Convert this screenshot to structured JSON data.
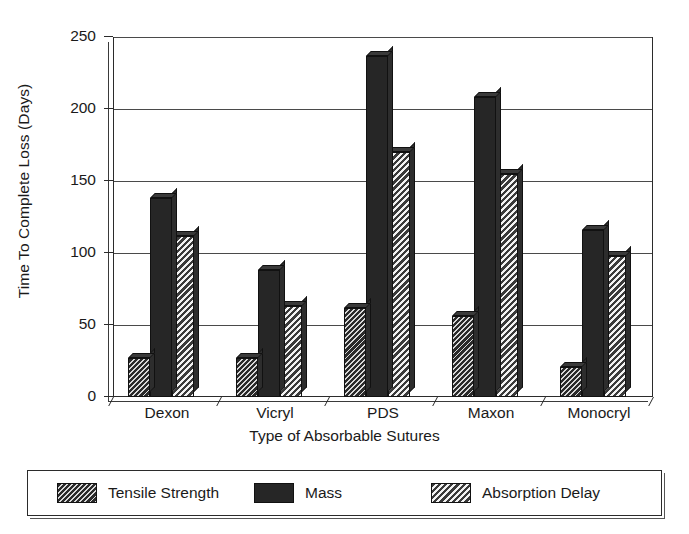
{
  "chart_data": {
    "type": "bar",
    "title": "",
    "xlabel": "Type of Absorbable Sutures",
    "ylabel": "Time To Complete Loss (Days)",
    "categories": [
      "Dexon",
      "Vicryl",
      "PDS",
      "Maxon",
      "Monocryl"
    ],
    "series": [
      {
        "name": "Tensile Strength",
        "values": [
          27,
          27,
          62,
          56,
          21
        ]
      },
      {
        "name": "Mass",
        "values": [
          138,
          88,
          237,
          208,
          116
        ]
      },
      {
        "name": "Absorption Delay",
        "values": [
          112,
          63,
          170,
          155,
          98
        ]
      }
    ],
    "ylim": [
      0,
      250
    ],
    "yticks": [
      0,
      50,
      100,
      150,
      200,
      250
    ],
    "ytick_labels": [
      "0",
      "50",
      "100",
      "150",
      "200",
      "250"
    ],
    "grid": true,
    "legend_position": "bottom",
    "style": "3d-bars-hatched-grayscale"
  },
  "axes": {
    "y_label": "Time To Complete Loss (Days)",
    "x_label": "Type of Absorbable Sutures",
    "y_ticks": [
      "250",
      "200",
      "150",
      "100",
      "50",
      "0"
    ],
    "x_categories": [
      "Dexon",
      "Vicryl",
      "PDS",
      "Maxon",
      "Monocryl"
    ]
  },
  "legend": {
    "items": [
      {
        "label": "Tensile Strength",
        "pattern": "dark-hatch",
        "color": "#2a2a2a"
      },
      {
        "label": "Mass",
        "pattern": "solid-dark",
        "color": "#262626"
      },
      {
        "label": "Absorption Delay",
        "pattern": "light-hatch",
        "color": "#3a3a3a"
      }
    ]
  },
  "colors": {
    "background": "#ffffff",
    "axis": "#2b2b2b",
    "grid": "#4a4a4a",
    "text": "#1a1a1a"
  }
}
